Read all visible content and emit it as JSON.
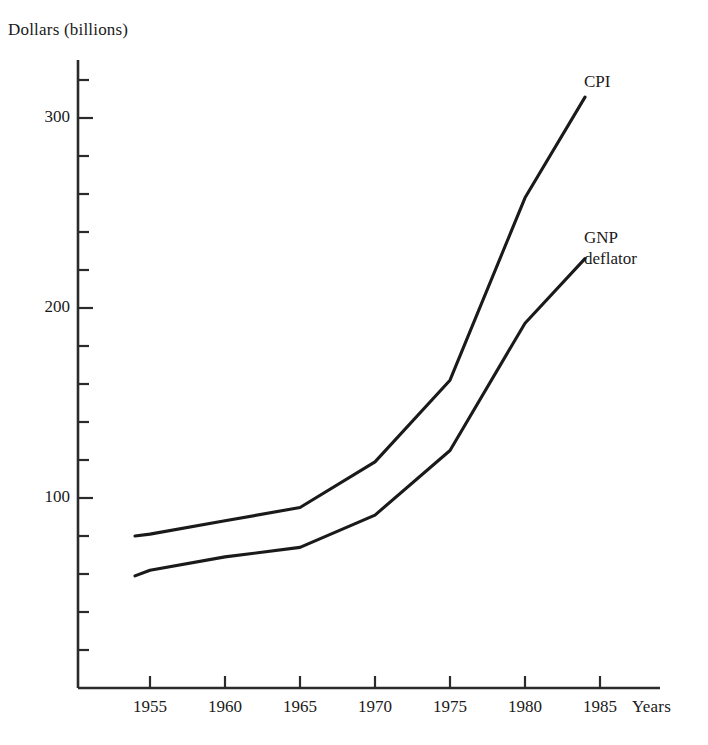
{
  "chart_data": {
    "type": "line",
    "title": "",
    "ylabel": "Dollars (billions)",
    "xlabel": "Years",
    "x": [
      1954,
      1955,
      1960,
      1965,
      1970,
      1975,
      1980,
      1984
    ],
    "xlim": [
      1953,
      1986
    ],
    "ylim": [
      0,
      330
    ],
    "xticks": [
      "1955",
      "1960",
      "1965",
      "1970",
      "1975",
      "1980",
      "1985"
    ],
    "xtick_values": [
      1955,
      1960,
      1965,
      1970,
      1975,
      1980,
      1985
    ],
    "yticks": [
      "100",
      "200",
      "300"
    ],
    "ytick_values": [
      100,
      200,
      300
    ],
    "y_minor_tick_step": 20,
    "grid": false,
    "legend_position": "inline-right-of-line-ends",
    "line_color": "#1a1a1a",
    "background_color": "#ffffff",
    "series": [
      {
        "name": "CPI",
        "label_lines": "CPI",
        "values": [
          80,
          81,
          88,
          95,
          119,
          162,
          258,
          311
        ]
      },
      {
        "name": "GNP deflator",
        "label_lines": "GNP\ndeflator",
        "values": [
          59,
          62,
          69,
          74,
          91,
          125,
          192,
          226
        ]
      }
    ]
  },
  "labels": {
    "ylabel": "Dollars (billions)",
    "xlabel": "Years",
    "ytick_100": "100",
    "ytick_200": "200",
    "ytick_300": "300",
    "xtick_1955": "1955",
    "xtick_1960": "1960",
    "xtick_1965": "1965",
    "xtick_1970": "1970",
    "xtick_1975": "1975",
    "xtick_1980": "1980",
    "xtick_1985": "1985",
    "series_cpi": "CPI",
    "series_gnp_line1": "GNP",
    "series_gnp_line2": "deflator"
  }
}
